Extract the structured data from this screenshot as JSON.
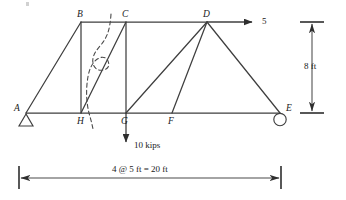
{
  "figure": {
    "type": "statics-truss-free-body-diagram",
    "width": 346,
    "height": 200,
    "background": "#ffffff",
    "line_color": "#3f3f3f",
    "text_color": "#1a1a1a"
  },
  "joints": [
    {
      "id": "A",
      "label": "A",
      "x": 26,
      "y": 113,
      "label_x": 14,
      "label_y": 104,
      "support": "pin"
    },
    {
      "id": "H",
      "label": "H",
      "x": 81,
      "y": 113,
      "label_x": 77,
      "label_y": 117,
      "support": "none"
    },
    {
      "id": "G",
      "label": "G",
      "x": 126,
      "y": 113,
      "label_x": 121,
      "label_y": 117,
      "support": "none"
    },
    {
      "id": "F",
      "label": "F",
      "x": 172,
      "y": 113,
      "label_x": 168,
      "label_y": 117,
      "support": "none"
    },
    {
      "id": "E",
      "label": "E",
      "x": 280,
      "y": 113,
      "label_x": 286,
      "label_y": 104,
      "support": "roller"
    },
    {
      "id": "B",
      "label": "B",
      "x": 81,
      "y": 22,
      "label_x": 77,
      "label_y": 10,
      "support": "none"
    },
    {
      "id": "C",
      "label": "C",
      "x": 126,
      "y": 22,
      "label_x": 122,
      "label_y": 10,
      "support": "none"
    },
    {
      "id": "D",
      "label": "D",
      "x": 207,
      "y": 22,
      "label_x": 203,
      "label_y": 10,
      "support": "none"
    }
  ],
  "members": [
    {
      "name": "bottom-chord-A-E",
      "from": "A",
      "to": "E",
      "kind": "chord"
    },
    {
      "name": "top-chord-B-D",
      "from": "B",
      "to": "D",
      "kind": "chord"
    },
    {
      "name": "diagonal-A-B",
      "from": "A",
      "to": "B",
      "kind": "diagonal"
    },
    {
      "name": "diagonal-H-C",
      "from": "H",
      "to": "C",
      "kind": "diagonal"
    },
    {
      "name": "diagonal-G-D",
      "from": "G",
      "to": "D",
      "kind": "diagonal"
    },
    {
      "name": "diagonal-D-E",
      "from": "D",
      "to": "E",
      "kind": "diagonal"
    },
    {
      "name": "vertical-B-H",
      "from": "B",
      "to": "H",
      "kind": "vertical"
    },
    {
      "name": "vertical-C-G",
      "from": "C",
      "to": "G",
      "kind": "vertical"
    },
    {
      "name": "vertical-D-F",
      "from": "D",
      "to": "F",
      "kind": "vertical"
    }
  ],
  "supports": {
    "pin": {
      "at": "A",
      "shape": "triangle"
    },
    "roller": {
      "at": "E",
      "shape": "circle"
    }
  },
  "loads": [
    {
      "name": "horizontal-load-at-D",
      "label": "5",
      "magnitude": 5,
      "direction": "right",
      "at": "D",
      "label_x": 262,
      "label_y": 17
    },
    {
      "name": "vertical-load-at-G",
      "label": "10 kips",
      "magnitude": 10,
      "unit": "kips",
      "direction": "down",
      "at": "G",
      "label_x": 134,
      "label_y": 141
    }
  ],
  "section_cut": {
    "name": "section-cut-line",
    "style": "dashed",
    "description": "S-shaped dashed section cut passing between H and C"
  },
  "dimensions": {
    "height": {
      "label": "8 ft",
      "value": 8,
      "unit": "ft",
      "orientation": "vertical",
      "label_x": 305,
      "label_y": 63
    },
    "span": {
      "label": "4 @ 5 ft = 20 ft",
      "panels": 4,
      "panel_length": 5,
      "total": 20,
      "unit": "ft",
      "orientation": "horizontal",
      "label_x": 112,
      "label_y": 165
    }
  }
}
